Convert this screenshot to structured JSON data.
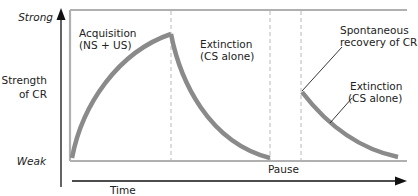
{
  "diagram": {
    "y_axis": {
      "label_line1": "Strength",
      "label_line2": "of CR",
      "top_label": "Strong",
      "bottom_label": "Weak"
    },
    "x_axis": {
      "label": "Time"
    },
    "phases": {
      "acquisition": {
        "line1": "Acquisition",
        "line2": "(NS + US)"
      },
      "extinction1": {
        "line1": "Extinction",
        "line2": "(CS alone)"
      },
      "pause": {
        "label": "Pause"
      },
      "recovery": {
        "line1": "Spontaneous",
        "line2": "recovery of CR"
      },
      "extinction2": {
        "line1": "Extinction",
        "line2": "(CS alone)"
      }
    },
    "colors": {
      "curve": "#8a8a8a",
      "frame": "#b0b0b0",
      "dashed": "#b8b8b8",
      "axis": "#111111",
      "text": "#222222"
    }
  }
}
